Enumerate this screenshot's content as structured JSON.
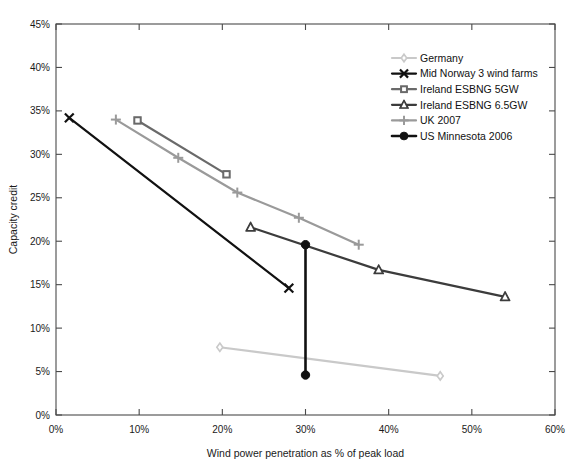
{
  "chart_data": {
    "type": "line",
    "title": "",
    "xlabel": "Wind power penetration as % of peak load",
    "ylabel": "Capacity credit",
    "xlim": [
      0,
      60
    ],
    "ylim": [
      0,
      45
    ],
    "grid": false,
    "legend_position": "upper-right-inside",
    "xticks": [
      "0%",
      "10%",
      "20%",
      "30%",
      "40%",
      "50%",
      "60%"
    ],
    "xtick_values": [
      0,
      10,
      20,
      30,
      40,
      50,
      60
    ],
    "yticks": [
      "0%",
      "5%",
      "10%",
      "15%",
      "20%",
      "25%",
      "30%",
      "35%",
      "40%",
      "45%"
    ],
    "ytick_values": [
      0,
      5,
      10,
      15,
      20,
      25,
      30,
      35,
      40,
      45
    ],
    "series": [
      {
        "name": "Germany",
        "color": "#c9c9c9",
        "marker": "diamond",
        "points": [
          [
            19.7,
            7.8
          ],
          [
            46.2,
            4.5
          ]
        ]
      },
      {
        "name": "Mid Norway 3 wind farms",
        "color": "#111111",
        "marker": "x",
        "points": [
          [
            1.6,
            34.2
          ],
          [
            28.0,
            14.6
          ]
        ]
      },
      {
        "name": "Ireland ESBNG 5GW",
        "color": "#6a6a6a",
        "marker": "square",
        "points": [
          [
            9.8,
            33.9
          ],
          [
            20.5,
            27.7
          ]
        ]
      },
      {
        "name": "Ireland ESBNG 6.5GW",
        "color": "#3c3c3c",
        "marker": "triangle",
        "points": [
          [
            23.4,
            21.6
          ],
          [
            38.8,
            16.7
          ],
          [
            54.0,
            13.6
          ]
        ]
      },
      {
        "name": "UK 2007",
        "color": "#9a9a9a",
        "marker": "plus",
        "points": [
          [
            7.2,
            34.0
          ],
          [
            14.7,
            29.6
          ],
          [
            21.8,
            25.6
          ],
          [
            29.2,
            22.7
          ],
          [
            36.4,
            19.6
          ]
        ]
      },
      {
        "name": "US Minnesota 2006",
        "color": "#111111",
        "marker": "circle",
        "points": [
          [
            30.0,
            19.6
          ],
          [
            30.0,
            4.6
          ]
        ]
      }
    ]
  }
}
